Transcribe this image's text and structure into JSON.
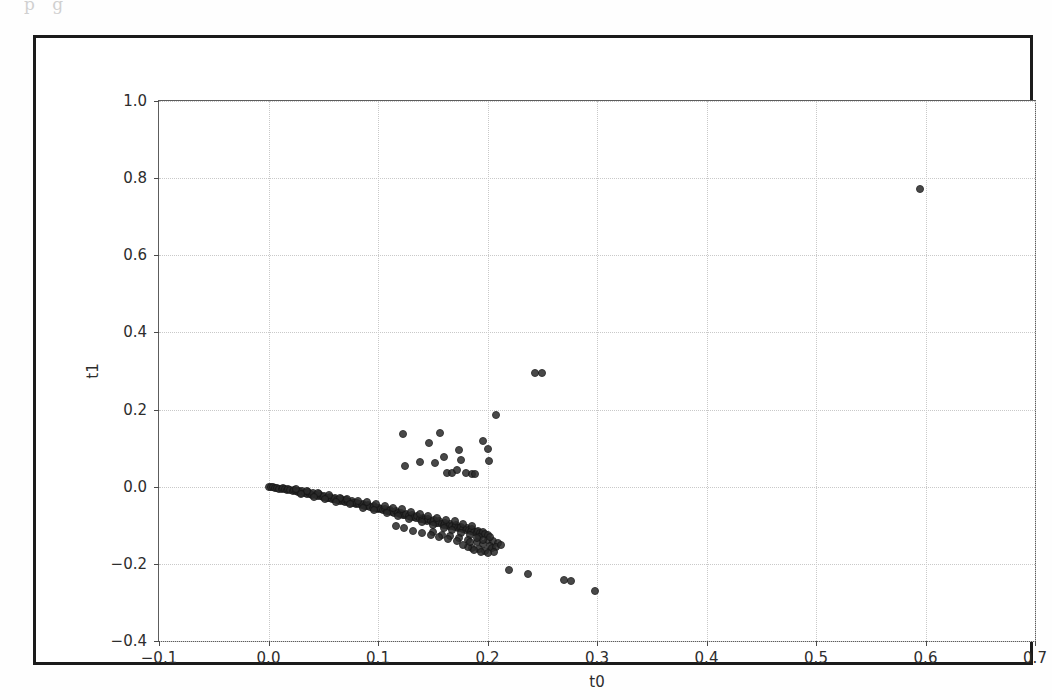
{
  "page": {
    "scan_bleed_text": "p    g"
  },
  "chart_data": {
    "type": "scatter",
    "title": "",
    "xlabel": "t0",
    "ylabel": "t1",
    "xlim": [
      -0.1,
      0.7
    ],
    "ylim": [
      -0.4,
      1.0
    ],
    "xticks": [
      -0.1,
      0.0,
      0.1,
      0.2,
      0.3,
      0.4,
      0.5,
      0.6,
      0.7
    ],
    "xticklabels": [
      "-0.1",
      "0.0",
      "0.1",
      "0.2",
      "0.3",
      "0.4",
      "0.5",
      "0.6",
      "0.7"
    ],
    "yticks": [
      -0.4,
      -0.2,
      0.0,
      0.2,
      0.4,
      0.6,
      0.8,
      1.0
    ],
    "yticklabels": [
      "-0.4",
      "-0.2",
      "0.0",
      "0.2",
      "0.4",
      "0.6",
      "0.8",
      "1.0"
    ],
    "grid": true,
    "grid_style": "dotted",
    "grid_color": "#c9c9c9",
    "marker_color": "#2b2b2b",
    "marker_edge_color": "#161616",
    "marker_size": 8,
    "legend": null,
    "series": [
      {
        "name": "samples",
        "points": [
          [
            0.0,
            0.0
          ],
          [
            0.002,
            -0.001
          ],
          [
            0.004,
            -0.002
          ],
          [
            0.006,
            -0.003
          ],
          [
            0.008,
            -0.004
          ],
          [
            0.01,
            -0.005
          ],
          [
            0.012,
            -0.006
          ],
          [
            0.013,
            -0.004
          ],
          [
            0.015,
            -0.007
          ],
          [
            0.017,
            -0.008
          ],
          [
            0.018,
            -0.006
          ],
          [
            0.02,
            -0.009
          ],
          [
            0.022,
            -0.011
          ],
          [
            0.023,
            -0.008
          ],
          [
            0.025,
            -0.012
          ],
          [
            0.027,
            -0.013
          ],
          [
            0.028,
            -0.01
          ],
          [
            0.03,
            -0.015
          ],
          [
            0.031,
            -0.012
          ],
          [
            0.033,
            -0.016
          ],
          [
            0.035,
            -0.018
          ],
          [
            0.036,
            -0.014
          ],
          [
            0.038,
            -0.019
          ],
          [
            0.04,
            -0.021
          ],
          [
            0.041,
            -0.017
          ],
          [
            0.043,
            -0.022
          ],
          [
            0.045,
            -0.024
          ],
          [
            0.046,
            -0.02
          ],
          [
            0.048,
            -0.025
          ],
          [
            0.05,
            -0.027
          ],
          [
            0.051,
            -0.023
          ],
          [
            0.053,
            -0.028
          ],
          [
            0.055,
            -0.03
          ],
          [
            0.056,
            -0.026
          ],
          [
            0.058,
            -0.031
          ],
          [
            0.06,
            -0.033
          ],
          [
            0.061,
            -0.029
          ],
          [
            0.063,
            -0.034
          ],
          [
            0.065,
            -0.036
          ],
          [
            0.066,
            -0.032
          ],
          [
            0.068,
            -0.037
          ],
          [
            0.07,
            -0.039
          ],
          [
            0.071,
            -0.035
          ],
          [
            0.073,
            -0.04
          ],
          [
            0.075,
            -0.042
          ],
          [
            0.076,
            -0.038
          ],
          [
            0.078,
            -0.043
          ],
          [
            0.08,
            -0.045
          ],
          [
            0.081,
            -0.041
          ],
          [
            0.083,
            -0.046
          ],
          [
            0.085,
            -0.048
          ],
          [
            0.086,
            -0.044
          ],
          [
            0.088,
            -0.05
          ],
          [
            0.09,
            -0.051
          ],
          [
            0.091,
            -0.047
          ],
          [
            0.093,
            -0.053
          ],
          [
            0.095,
            -0.055
          ],
          [
            0.096,
            -0.05
          ],
          [
            0.098,
            -0.056
          ],
          [
            0.1,
            -0.058
          ],
          [
            0.101,
            -0.054
          ],
          [
            0.103,
            -0.059
          ],
          [
            0.105,
            -0.061
          ],
          [
            0.106,
            -0.057
          ],
          [
            0.108,
            -0.063
          ],
          [
            0.11,
            -0.064
          ],
          [
            0.111,
            -0.06
          ],
          [
            0.113,
            -0.066
          ],
          [
            0.115,
            -0.068
          ],
          [
            0.116,
            -0.063
          ],
          [
            0.118,
            -0.069
          ],
          [
            0.12,
            -0.071
          ],
          [
            0.121,
            -0.067
          ],
          [
            0.123,
            -0.073
          ],
          [
            0.125,
            -0.074
          ],
          [
            0.126,
            -0.07
          ],
          [
            0.128,
            -0.076
          ],
          [
            0.13,
            -0.078
          ],
          [
            0.131,
            -0.073
          ],
          [
            0.133,
            -0.079
          ],
          [
            0.135,
            -0.081
          ],
          [
            0.136,
            -0.077
          ],
          [
            0.138,
            -0.083
          ],
          [
            0.14,
            -0.084
          ],
          [
            0.141,
            -0.08
          ],
          [
            0.143,
            -0.086
          ],
          [
            0.145,
            -0.088
          ],
          [
            0.146,
            -0.083
          ],
          [
            0.148,
            -0.09
          ],
          [
            0.15,
            -0.091
          ],
          [
            0.151,
            -0.087
          ],
          [
            0.153,
            -0.093
          ],
          [
            0.155,
            -0.095
          ],
          [
            0.156,
            -0.09
          ],
          [
            0.158,
            -0.096
          ],
          [
            0.16,
            -0.098
          ],
          [
            0.161,
            -0.094
          ],
          [
            0.163,
            -0.1
          ],
          [
            0.165,
            -0.101
          ],
          [
            0.166,
            -0.097
          ],
          [
            0.168,
            -0.103
          ],
          [
            0.17,
            -0.105
          ],
          [
            0.171,
            -0.1
          ],
          [
            0.173,
            -0.106
          ],
          [
            0.175,
            -0.108
          ],
          [
            0.176,
            -0.104
          ],
          [
            0.178,
            -0.11
          ],
          [
            0.18,
            -0.111
          ],
          [
            0.181,
            -0.107
          ],
          [
            0.183,
            -0.113
          ],
          [
            0.185,
            -0.115
          ],
          [
            0.186,
            -0.11
          ],
          [
            0.188,
            -0.117
          ],
          [
            0.19,
            -0.118
          ],
          [
            0.191,
            -0.114
          ],
          [
            0.193,
            -0.12
          ],
          [
            0.195,
            -0.122
          ],
          [
            0.196,
            -0.117
          ],
          [
            0.198,
            -0.123
          ],
          [
            0.2,
            -0.125
          ],
          [
            0.025,
            -0.006
          ],
          [
            0.035,
            -0.011
          ],
          [
            0.045,
            -0.017
          ],
          [
            0.055,
            -0.022
          ],
          [
            0.065,
            -0.028
          ],
          [
            0.072,
            -0.031
          ],
          [
            0.082,
            -0.036
          ],
          [
            0.09,
            -0.04
          ],
          [
            0.098,
            -0.046
          ],
          [
            0.106,
            -0.049
          ],
          [
            0.114,
            -0.055
          ],
          [
            0.122,
            -0.059
          ],
          [
            0.13,
            -0.065
          ],
          [
            0.138,
            -0.07
          ],
          [
            0.146,
            -0.075
          ],
          [
            0.154,
            -0.08
          ],
          [
            0.162,
            -0.085
          ],
          [
            0.17,
            -0.09
          ],
          [
            0.178,
            -0.096
          ],
          [
            0.186,
            -0.101
          ],
          [
            0.03,
            -0.02
          ],
          [
            0.042,
            -0.027
          ],
          [
            0.052,
            -0.033
          ],
          [
            0.062,
            -0.039
          ],
          [
            0.074,
            -0.046
          ],
          [
            0.086,
            -0.054
          ],
          [
            0.096,
            -0.061
          ],
          [
            0.108,
            -0.069
          ],
          [
            0.118,
            -0.076
          ],
          [
            0.128,
            -0.084
          ],
          [
            0.14,
            -0.092
          ],
          [
            0.15,
            -0.099
          ],
          [
            0.16,
            -0.107
          ],
          [
            0.168,
            -0.113
          ],
          [
            0.176,
            -0.12
          ],
          [
            0.184,
            -0.126
          ],
          [
            0.192,
            -0.131
          ],
          [
            0.2,
            -0.137
          ],
          [
            0.205,
            -0.142
          ],
          [
            0.21,
            -0.147
          ],
          [
            0.15,
            -0.118
          ],
          [
            0.158,
            -0.124
          ],
          [
            0.166,
            -0.129
          ],
          [
            0.174,
            -0.134
          ],
          [
            0.182,
            -0.139
          ],
          [
            0.19,
            -0.144
          ],
          [
            0.196,
            -0.149
          ],
          [
            0.202,
            -0.154
          ],
          [
            0.186,
            -0.158
          ],
          [
            0.192,
            -0.162
          ],
          [
            0.198,
            -0.166
          ],
          [
            0.204,
            -0.16
          ],
          [
            0.208,
            -0.155
          ],
          [
            0.212,
            -0.15
          ],
          [
            0.206,
            -0.17
          ],
          [
            0.2,
            -0.172
          ],
          [
            0.194,
            -0.168
          ],
          [
            0.188,
            -0.163
          ],
          [
            0.182,
            -0.157
          ],
          [
            0.178,
            -0.151
          ],
          [
            0.202,
            -0.131
          ],
          [
            0.196,
            -0.137
          ],
          [
            0.19,
            -0.132
          ],
          [
            0.184,
            -0.144
          ],
          [
            0.172,
            -0.141
          ],
          [
            0.164,
            -0.136
          ],
          [
            0.156,
            -0.131
          ],
          [
            0.148,
            -0.126
          ],
          [
            0.14,
            -0.12
          ],
          [
            0.132,
            -0.114
          ],
          [
            0.124,
            -0.108
          ],
          [
            0.116,
            -0.102
          ],
          [
            0.22,
            -0.215
          ],
          [
            0.237,
            -0.227
          ],
          [
            0.27,
            -0.241
          ],
          [
            0.276,
            -0.245
          ],
          [
            0.298,
            -0.27
          ],
          [
            0.123,
            0.137
          ],
          [
            0.125,
            0.055
          ],
          [
            0.138,
            0.064
          ],
          [
            0.147,
            0.113
          ],
          [
            0.152,
            0.061
          ],
          [
            0.157,
            0.138
          ],
          [
            0.16,
            0.076
          ],
          [
            0.163,
            0.035
          ],
          [
            0.168,
            0.036
          ],
          [
            0.172,
            0.043
          ],
          [
            0.174,
            0.096
          ],
          [
            0.176,
            0.068
          ],
          [
            0.18,
            0.035
          ],
          [
            0.186,
            0.033
          ],
          [
            0.189,
            0.033
          ],
          [
            0.196,
            0.119
          ],
          [
            0.2,
            0.097
          ],
          [
            0.201,
            0.066
          ],
          [
            0.208,
            0.187
          ],
          [
            0.243,
            0.295
          ],
          [
            0.25,
            0.296
          ],
          [
            0.595,
            0.772
          ]
        ]
      }
    ]
  }
}
